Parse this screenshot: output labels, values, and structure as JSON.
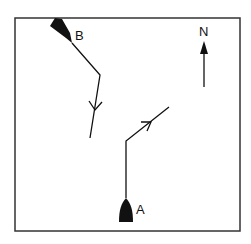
{
  "diagram": {
    "type": "vessel-course-plot",
    "frame": {
      "x": 15,
      "y": 18,
      "width": 225,
      "height": 213
    },
    "colors": {
      "ink": "#111111",
      "background": "#ffffff"
    },
    "north_label": "N",
    "vessels": [
      {
        "id": "A",
        "label": "A"
      },
      {
        "id": "B",
        "label": "B"
      }
    ]
  }
}
